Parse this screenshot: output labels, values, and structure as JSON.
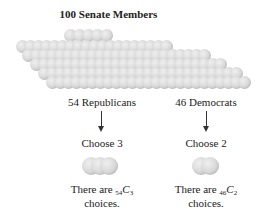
{
  "title": "100 Senate Members",
  "groups": [
    {
      "label": "54 Republicans",
      "choose": "Choose 3",
      "count": 54,
      "selected": 3,
      "result_prefix": "There are ",
      "result_pre_sub": "54",
      "result_symbol": "C",
      "result_post_sub": "3",
      "result_line2": "choices."
    },
    {
      "label": "46 Democrats",
      "choose": "Choose 2",
      "count": 46,
      "selected": 2,
      "result_prefix": "There are ",
      "result_pre_sub": "46",
      "result_symbol": "C",
      "result_post_sub": "2",
      "result_line2": "choices."
    }
  ],
  "total_members": 100,
  "colors": {
    "ball": "#d4d4d4",
    "text": "#222222",
    "arrow": "#333333"
  }
}
